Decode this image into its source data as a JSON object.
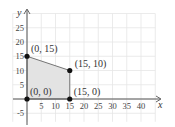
{
  "chart_data": {
    "type": "scatter",
    "title": "",
    "xlabel": "x",
    "ylabel": "y",
    "xlim": [
      -5,
      47
    ],
    "ylim": [
      -9,
      30
    ],
    "grid": true,
    "grid_step": 5,
    "x_ticks": [
      "5",
      "10",
      "15",
      "20",
      "25",
      "30",
      "35",
      "40"
    ],
    "y_ticks": [
      "25",
      "20",
      "15",
      "10",
      "5",
      "-5"
    ],
    "region": {
      "fill": "#e3e3e3",
      "vertices": [
        [
          0,
          0
        ],
        [
          0,
          15
        ],
        [
          15,
          10
        ],
        [
          15,
          0
        ]
      ]
    },
    "points": [
      {
        "x": 0,
        "y": 15,
        "label": "(0, 15)"
      },
      {
        "x": 15,
        "y": 10,
        "label": "(15, 10)"
      },
      {
        "x": 0,
        "y": 0,
        "label": "(0, 0)"
      },
      {
        "x": 15,
        "y": 0,
        "label": "(15, 0)"
      }
    ],
    "colors": {
      "grid": "#e6e6e6",
      "axis": "#555555",
      "point": "#111111",
      "edge": "#666666"
    }
  }
}
